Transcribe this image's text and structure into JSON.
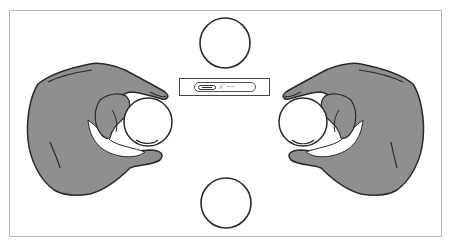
{
  "figure": {
    "colors": {
      "background": "#ffffff",
      "frame_border": "#b8b8b8",
      "hand_fill": "#8f8f8f",
      "outline": "#2a2a2a",
      "ball_fill": "#ffffff"
    },
    "label_plate": {
      "badge_icon": "capsule-icon",
      "text": "ﾊﾞｰｰ"
    },
    "elements": {
      "top_circle": {
        "cx": 225,
        "cy": 43,
        "r": 25
      },
      "bottom_circle": {
        "cx": 226,
        "cy": 203,
        "r": 25
      },
      "left_ball": {
        "cx": 148,
        "cy": 122,
        "r": 24
      },
      "right_ball": {
        "cx": 303,
        "cy": 122,
        "r": 24
      }
    }
  }
}
